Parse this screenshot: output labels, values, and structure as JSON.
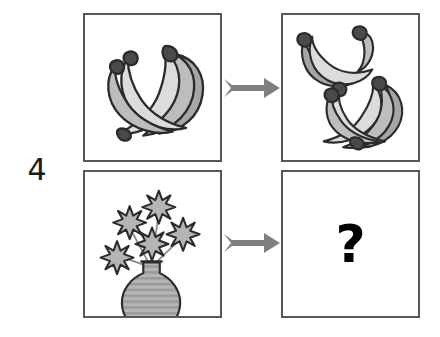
{
  "item": {
    "number": "4",
    "type": "visual-analogy"
  },
  "panels": [
    {
      "id": "panel-a",
      "position": "top-left",
      "content_label": "bunch of bananas",
      "object_count": 1,
      "description": "one whole bunch of five bananas"
    },
    {
      "id": "panel-b",
      "position": "top-right",
      "content_label": "two separated bunches of bananas",
      "object_count": 2,
      "description": "the bunch divided into two smaller bunches"
    },
    {
      "id": "panel-c",
      "position": "bottom-left",
      "content_label": "flowers in a vase",
      "object_count": 1,
      "description": "five eight-petal flowers arranged in a striped round vase"
    },
    {
      "id": "panel-d",
      "position": "bottom-right",
      "content_label": "unknown answer",
      "object_count": 0,
      "description": "empty panel containing a question mark"
    }
  ],
  "arrows": [
    {
      "id": "arrow-top",
      "direction": "right",
      "label": "transforms into"
    },
    {
      "id": "arrow-bottom",
      "direction": "right",
      "label": "transforms into"
    }
  ],
  "question_mark": "?",
  "colors": {
    "panel_border": "#575757",
    "arrow": "#808080",
    "outline": "#2b2b2b",
    "fill_light": "#dcdcdc",
    "fill_mid": "#bdbdbd",
    "fill_dark": "#a6a6a6",
    "text": "#1a1a1a",
    "background": "#ffffff"
  }
}
